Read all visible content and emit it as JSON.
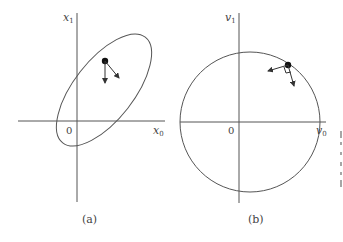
{
  "panels": [
    {
      "id": "a",
      "caption": "(a)",
      "x_axis_label": "x",
      "x_axis_sub": "0",
      "y_axis_label": "x",
      "y_axis_sub": "1",
      "origin_label": "0",
      "curve_shape": "tilted ellipse",
      "point": "state point on ellipse",
      "vectors": [
        "downward vector",
        "down-right vector"
      ]
    },
    {
      "id": "b",
      "caption": "(b)",
      "x_axis_label": "v",
      "x_axis_sub": "0",
      "y_axis_label": "v",
      "y_axis_sub": "1",
      "origin_label": "0",
      "curve_shape": "circle",
      "point": "state point on circle",
      "vectors": [
        "left vector",
        "downward vector"
      ],
      "marker": "right-angle marker"
    }
  ]
}
